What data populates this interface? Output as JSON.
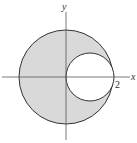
{
  "diagram": {
    "axes": {
      "x_label": "x",
      "y_label": "y",
      "tick_label_x": "2"
    },
    "outer_circle": {
      "center": [
        0,
        0
      ],
      "radius": 2,
      "fill": "#d9d9d9",
      "stroke": "#333333"
    },
    "inner_circle": {
      "center": [
        1,
        0
      ],
      "radius": 1,
      "fill": "#ffffff",
      "stroke": "#333333"
    },
    "colors": {
      "shade": "#d9d9d9",
      "line": "#333333",
      "background": "#ffffff"
    }
  }
}
